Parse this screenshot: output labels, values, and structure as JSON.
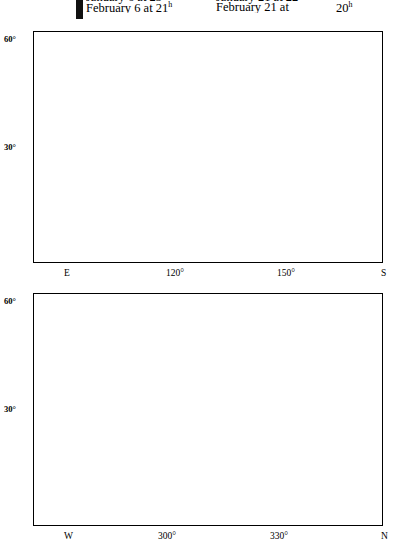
{
  "header": {
    "marker": "vertical-bar",
    "columns": [
      {
        "cut_line": "January 6 at 23",
        "cut_sup": "h",
        "line": "February 6 at 21",
        "sup": "h"
      },
      {
        "cut_line": "January 21 at 22",
        "cut_sup": "h",
        "line": "February 21 at",
        "sup": "h",
        "hour": "20"
      }
    ]
  },
  "charts": [
    {
      "id": "top",
      "name": "southern-evening-sky-chart",
      "y_axis": {
        "labels": [
          "60",
          "30"
        ],
        "unit": "°",
        "tick_step_deg": 10,
        "range": [
          0,
          65
        ]
      },
      "x_axis": {
        "ticks": [
          {
            "label": "E",
            "az": 90
          },
          {
            "label": "120°",
            "az": 120
          },
          {
            "label": "150°",
            "az": 150
          },
          {
            "label": "S",
            "az": 180
          }
        ]
      },
      "constellations": [
        {
          "name": "LYNX",
          "x": 98,
          "y": 32
        },
        {
          "name": "GEMINI",
          "x": 265,
          "y": 63
        },
        {
          "name": "CANCER",
          "x": 217,
          "y": 98
        },
        {
          "name": "CANIS MINOR",
          "x": 307,
          "y": 96
        },
        {
          "name": "LEO",
          "x": 78,
          "y": 170
        },
        {
          "name": "HYDRA",
          "x": 205,
          "y": 175
        },
        {
          "name": "CANIS MAJOR",
          "x": 352,
          "y": 208
        }
      ],
      "stars_named": [
        {
          "name": "Pollux",
          "x": 192,
          "y": 42
        },
        {
          "name": "Procyon",
          "x": 300,
          "y": 122
        },
        {
          "name": "Regulus",
          "x": 152,
          "y": 165
        },
        {
          "name": "Sirius",
          "x": 320,
          "y": 198
        }
      ],
      "ecliptic_labels": [
        "100",
        "110",
        "120",
        "130",
        "140",
        "150",
        "160",
        "170"
      ]
    },
    {
      "id": "bottom",
      "name": "northern-evening-sky-chart",
      "y_axis": {
        "labels": [
          "60",
          "30"
        ],
        "unit": "°",
        "tick_step_deg": 10,
        "range": [
          0,
          65
        ]
      },
      "x_axis": {
        "ticks": [
          {
            "label": "W",
            "az": 270
          },
          {
            "label": "300°",
            "az": 300
          },
          {
            "label": "330°",
            "az": 330
          },
          {
            "label": "N",
            "az": 360
          }
        ]
      },
      "constellations": [
        {
          "name": "PERSEUS",
          "x": 68,
          "y": 23
        },
        {
          "name": "CASSIOPEIA",
          "x": 222,
          "y": 36
        },
        {
          "name": "ANDROMEDA",
          "x": 112,
          "y": 82
        },
        {
          "name": "CEPHEUS",
          "x": 282,
          "y": 110
        },
        {
          "name": "ARIES",
          "x": 34,
          "y": 113
        },
        {
          "name": "PISCES",
          "x": 40,
          "y": 157
        },
        {
          "name": "PEGASUS",
          "x": 120,
          "y": 188
        },
        {
          "name": "CYGNUS",
          "x": 280,
          "y": 213
        }
      ],
      "stars_named": [
        {
          "name": "Polaris",
          "x": 348,
          "y": 38
        },
        {
          "name": "Deneb",
          "x": 268,
          "y": 178
        },
        {
          "name": "Vega",
          "x": 362,
          "y": 227
        }
      ],
      "ecliptic_labels": [
        "10"
      ]
    }
  ]
}
